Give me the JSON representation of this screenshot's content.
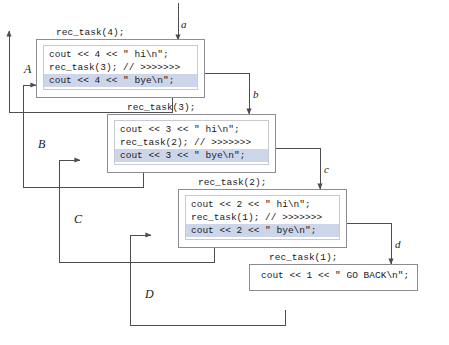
{
  "diagram": {
    "frames": [
      {
        "caption": "rec_task(4);",
        "lines": [
          {
            "text": "cout << 4 << \" hi\\n\";",
            "highlighted": false
          },
          {
            "text": "rec_task(3); // >>>>>>>",
            "highlighted": false
          },
          {
            "text": "cout << 4 << \" bye\\n\";",
            "highlighted": true
          }
        ]
      },
      {
        "caption": "rec_task(3);",
        "lines": [
          {
            "text": "cout << 3 << \" hi\\n\";",
            "highlighted": false
          },
          {
            "text": "rec_task(2); // >>>>>>>",
            "highlighted": false
          },
          {
            "text": "cout << 3 << \" bye\\n\";",
            "highlighted": true
          }
        ]
      },
      {
        "caption": "rec_task(2);",
        "lines": [
          {
            "text": "cout << 2 << \" hi\\n\";",
            "highlighted": false
          },
          {
            "text": "rec_task(1); // >>>>>>>",
            "highlighted": false
          },
          {
            "text": "cout << 2 << \" bye\\n\";",
            "highlighted": true
          }
        ]
      },
      {
        "caption": "rec_task(1);",
        "lines": [
          {
            "text": "cout << 1 << \" GO BACK\\n\";",
            "highlighted": false
          }
        ]
      }
    ],
    "call_labels": [
      {
        "id": "a",
        "text": "a"
      },
      {
        "id": "b",
        "text": "b"
      },
      {
        "id": "c",
        "text": "c"
      },
      {
        "id": "d",
        "text": "d"
      }
    ],
    "return_labels": [
      {
        "id": "A",
        "text": "A"
      },
      {
        "id": "B",
        "text": "B"
      },
      {
        "id": "C",
        "text": "C"
      },
      {
        "id": "D",
        "text": "D"
      }
    ],
    "colors": {
      "frame_border": "#8c8c92",
      "code_border": "#c9c9d2",
      "highlight": "#ccd5ea",
      "wire": "#4d4d4d",
      "text": "#1a1a1a",
      "background": "#ffffff"
    }
  }
}
